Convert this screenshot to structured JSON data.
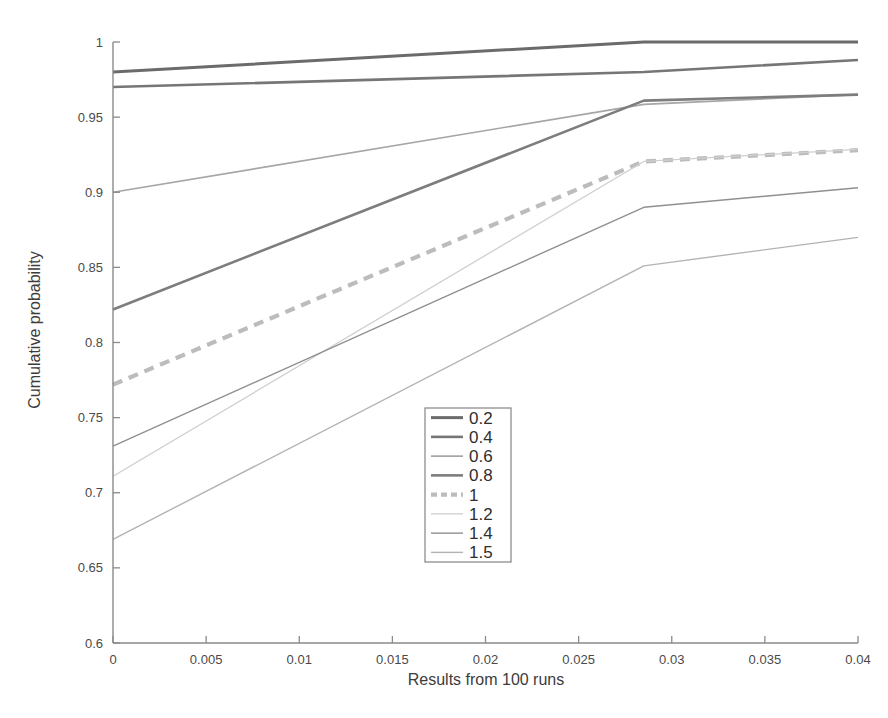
{
  "chart_data": {
    "type": "line",
    "title": "",
    "xlabel": "Results from 100 runs",
    "ylabel": "Cumulative probability",
    "xlim": [
      0,
      0.04
    ],
    "ylim": [
      0.6,
      1
    ],
    "xticks": [
      0,
      0.005,
      0.01,
      0.015,
      0.02,
      0.025,
      0.03,
      0.035,
      0.04
    ],
    "xticklabels": [
      "0",
      "0.005",
      "0.01",
      "0.015",
      "0.02",
      "0.025",
      "0.03",
      "0.035",
      "0.04"
    ],
    "yticks": [
      0.6,
      0.65,
      0.7,
      0.75,
      0.8,
      0.85,
      0.9,
      0.95,
      1
    ],
    "yticklabels": [
      "0.6",
      "0.65",
      "0.7",
      "0.75",
      "0.8",
      "0.85",
      "0.9",
      "0.95",
      "1"
    ],
    "grid": false,
    "legend_position": "center",
    "legend_title": "",
    "x": [
      0,
      0.0285,
      0.04
    ],
    "series": [
      {
        "name": "0.2",
        "label": "0.2",
        "values": [
          0.98,
          1.0,
          1.0
        ],
        "color": "#6b6b6b",
        "width": 3.0,
        "dash": "none"
      },
      {
        "name": "0.4",
        "label": "0.4",
        "values": [
          0.97,
          0.98,
          0.988
        ],
        "color": "#767676",
        "width": 2.6,
        "dash": "none"
      },
      {
        "name": "0.6",
        "label": "0.6",
        "values": [
          0.9,
          0.9585,
          0.965
        ],
        "color": "#a6a6a6",
        "width": 1.7,
        "dash": "none"
      },
      {
        "name": "0.8",
        "label": "0.8",
        "values": [
          0.822,
          0.961,
          0.965
        ],
        "color": "#7d7d7d",
        "width": 2.6,
        "dash": "none"
      },
      {
        "name": "1",
        "label": "1",
        "values": [
          0.772,
          0.9205,
          0.928
        ],
        "color": "#bcbcbc",
        "width": 4.2,
        "dash": "10,7"
      },
      {
        "name": "1.2",
        "label": "1.2",
        "values": [
          0.711,
          0.9205,
          0.9285
        ],
        "color": "#cfcfcf",
        "width": 1.3,
        "dash": "none"
      },
      {
        "name": "1.4",
        "label": "1.4",
        "values": [
          0.731,
          0.89,
          0.903
        ],
        "color": "#909090",
        "width": 1.4,
        "dash": "none"
      },
      {
        "name": "1.5",
        "label": "1.5",
        "values": [
          0.669,
          0.851,
          0.87
        ],
        "color": "#b3b3b3",
        "width": 1.4,
        "dash": "none"
      }
    ]
  },
  "figure": {
    "background": "#ffffff",
    "axis_color": "#8a8a8a",
    "plot_left": 113,
    "plot_right": 858,
    "plot_top": 42,
    "plot_bottom": 643
  }
}
